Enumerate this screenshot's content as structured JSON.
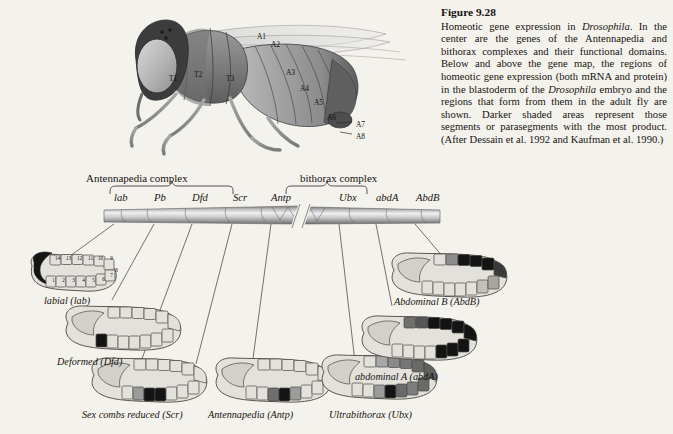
{
  "figure": {
    "number": "Figure 9.28",
    "caption": "Homeotic gene expression in Drosophila. In the center are the genes of the Antennapedia and bithorax complexes and their functional domains. Below and above the gene map, the regions of homeotic gene expression (both mRNA and protein) in the blastoderm of the Drosophila embryo and the regions that form from them in the adult fly are shown. Darker shaded areas represent those segments or parasegments with the most product. (After Dessain et al. 1992 and Kaufman et al. 1990.)",
    "caption_parts": [
      {
        "text": "Homeotic gene expression in ",
        "italic": false
      },
      {
        "text": "Drosophila",
        "italic": true
      },
      {
        "text": ". In the center are the genes of the Antennapedia and bithorax complexes and their functional domains. Below and above the gene map, the regions of homeotic gene expression (both mRNA and protein) in the blastoderm of the ",
        "italic": false
      },
      {
        "text": "Drosophila",
        "italic": true
      },
      {
        "text": " embryo and the regions that form from them in the adult fly are shown. Darker shaded areas represent those segments or parasegments with the most product. (After Dessain et al. 1992 and Kaufman et al. 1990.)",
        "italic": false
      }
    ]
  },
  "fly_diagram": {
    "name": "adult-drosophila-lateral-view",
    "segment_labels": [
      {
        "label": "T1",
        "x": 51,
        "y": 66
      },
      {
        "label": "T2",
        "x": 76,
        "y": 62
      },
      {
        "label": "T3",
        "x": 108,
        "y": 66
      },
      {
        "label": "A1",
        "x": 139,
        "y": 24
      },
      {
        "label": "A2",
        "x": 153,
        "y": 32
      },
      {
        "label": "A3",
        "x": 168,
        "y": 60
      },
      {
        "label": "A4",
        "x": 182,
        "y": 76
      },
      {
        "label": "A5",
        "x": 196,
        "y": 90
      },
      {
        "label": "A6",
        "x": 209,
        "y": 105
      },
      {
        "label": "A7",
        "x": 238,
        "y": 112
      },
      {
        "label": "A8",
        "x": 238,
        "y": 124
      }
    ]
  },
  "gene_map": {
    "complexes": [
      {
        "name": "Antennapedia complex",
        "label_x": 86,
        "label_y": 172
      },
      {
        "name": "bithorax complex",
        "label_x": 300,
        "label_y": 172
      }
    ],
    "genes": [
      {
        "symbol": "lab",
        "x": 10,
        "complex": "Antennapedia complex"
      },
      {
        "symbol": "Pb",
        "x": 50,
        "complex": "Antennapedia complex"
      },
      {
        "symbol": "Dfd",
        "x": 88,
        "complex": "Antennapedia complex"
      },
      {
        "symbol": "Scr",
        "x": 129,
        "complex": "Antennapedia complex"
      },
      {
        "symbol": "Antp",
        "x": 167,
        "complex": "Antennapedia complex"
      },
      {
        "symbol": "Ubx",
        "x": 235,
        "complex": "bithorax complex"
      },
      {
        "symbol": "abdA",
        "x": 272,
        "complex": "bithorax complex"
      },
      {
        "symbol": "AbdB",
        "x": 312,
        "complex": "bithorax complex"
      }
    ]
  },
  "embryos": [
    {
      "id": "labial",
      "label": "labial (lab)",
      "label_x": 44,
      "label_y": 295
    },
    {
      "id": "deformed",
      "label": "Deformed (Dfd)",
      "label_x": 57,
      "label_y": 356
    },
    {
      "id": "scr",
      "label": "Sex combs reduced (Scr)",
      "label_x": 82,
      "label_y": 409
    },
    {
      "id": "antp",
      "label": "Antennapedia (Antp)",
      "label_x": 208,
      "label_y": 409
    },
    {
      "id": "ubx",
      "label": "Ultrabithorax (Ubx)",
      "label_x": 329,
      "label_y": 409
    },
    {
      "id": "abda",
      "label": "abdominal A (abdA)",
      "label_x": 355,
      "label_y": 371
    },
    {
      "id": "abdb",
      "label": "Abdominal B (AbdB)",
      "label_x": 394,
      "label_y": 296
    }
  ],
  "labial_segment_numbers": {
    "top_row": [
      "14",
      "13",
      "12",
      "11",
      "10",
      "9"
    ],
    "bottom_row": [
      "1",
      "2",
      "3",
      "4",
      "5",
      "6",
      "7",
      "8"
    ]
  },
  "colors": {
    "page_background": "#f4f2ec",
    "ink": "#16130f",
    "embryo_fill": "#e3e1dc",
    "embryo_outline": "#4a4742",
    "dark_segment": "#141414",
    "mid_gray": "#8a8a8a",
    "light_gray": "#c9c7c2",
    "fly_body_dark": "#5a5a5a",
    "fly_body_mid": "#8f8f8f",
    "fly_body_light": "#b8b8b8"
  }
}
